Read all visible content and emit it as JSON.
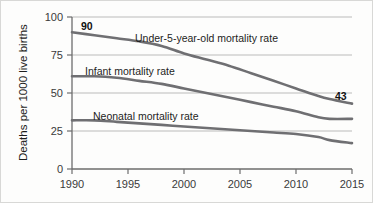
{
  "chart_data": {
    "type": "line",
    "title": "",
    "xlabel": "",
    "ylabel": "Deaths per 1000 live births",
    "xlim": [
      1990,
      2015
    ],
    "ylim": [
      0,
      100
    ],
    "yticks": [
      0,
      25,
      50,
      75,
      100
    ],
    "xticks": [
      1990,
      1995,
      2000,
      2005,
      2010,
      2015
    ],
    "grid": true,
    "legend_position": "inline-labels",
    "x": [
      1990,
      1992,
      1994,
      1996,
      1998,
      2000,
      2002,
      2004,
      2006,
      2008,
      2010,
      2012,
      2013,
      2015
    ],
    "series": [
      {
        "name": "Under-5-year-old mortality rate",
        "values": [
          90,
          88,
          86,
          84,
          81,
          76,
          72,
          68,
          63,
          58,
          53,
          48,
          46,
          43
        ],
        "color": "#6f6f72",
        "start_value": 90,
        "end_value": 43
      },
      {
        "name": "Infant mortality rate",
        "values": [
          61,
          61,
          60,
          58,
          56,
          53,
          50,
          47,
          44,
          41,
          38,
          34,
          33,
          33
        ],
        "color": "#6f6f72",
        "start_value": 61,
        "end_value": 33
      },
      {
        "name": "Neonatal mortality rate",
        "values": [
          32,
          32,
          31,
          30,
          29,
          28,
          27,
          26,
          25,
          24,
          23,
          21,
          19,
          17
        ],
        "color": "#6f6f72",
        "start_value": 32,
        "end_value": 17
      }
    ],
    "annotations": [
      {
        "text": "90",
        "x": 1990,
        "y": 90
      },
      {
        "text": "43",
        "x": 2015,
        "y": 43
      }
    ]
  },
  "axis": {
    "ylabel": "Deaths per 1000 live births",
    "ytick_0": "0",
    "ytick_25": "25",
    "ytick_50": "50",
    "ytick_75": "75",
    "ytick_100": "100",
    "xtick_1990": "1990",
    "xtick_1995": "1995",
    "xtick_2000": "2000",
    "xtick_2005": "2005",
    "xtick_2010": "2010",
    "xtick_2015": "2015"
  },
  "labels": {
    "under5": "Under-5-year-old mortality rate",
    "infant": "Infant mortality rate",
    "neonatal": "Neonatal mortality rate",
    "start_value": "90",
    "end_value": "43"
  }
}
